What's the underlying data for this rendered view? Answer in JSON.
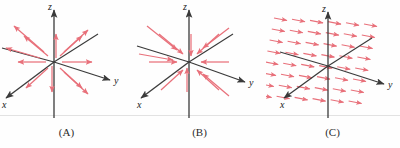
{
  "figure": {
    "kind": "vector-field-diagram-set",
    "background_color": "#fefefe",
    "axis_color": "#3a3a3a",
    "arrow_color": "#e8707a",
    "baseline_color": "#e2e2e2",
    "baseline_y": 115
  },
  "panels": [
    {
      "id": "A",
      "caption": "(A)",
      "field_type": "radial-outward",
      "description": "Arrows point away from the origin in all directions",
      "axes": {
        "x_label": "x",
        "y_label": "y",
        "z_label": "z"
      },
      "arrow_count": 12
    },
    {
      "id": "B",
      "caption": "(B)",
      "field_type": "radial-inward",
      "description": "Arrows point toward the origin from all directions",
      "axes": {
        "x_label": "x",
        "y_label": "y",
        "z_label": "z"
      },
      "arrow_count": 12
    },
    {
      "id": "C",
      "caption": "(C)",
      "field_type": "uniform-parallel",
      "description": "Grid of equal parallel arrows pointing in the +y direction",
      "axes": {
        "x_label": "x",
        "y_label": "y",
        "z_label": "z"
      },
      "arrow_count": 48
    }
  ]
}
